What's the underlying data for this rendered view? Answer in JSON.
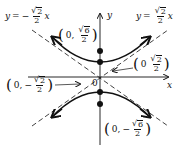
{
  "diagram": {
    "type": "hyperbola",
    "axes": {
      "x_label": "x",
      "y_label": "y",
      "origin_label": "0"
    },
    "asymptotes": [
      {
        "id": "neg",
        "lhs": "y",
        "eq": "=",
        "sign": "−",
        "num": "2",
        "den": "2",
        "var": "x"
      },
      {
        "id": "pos",
        "lhs": "y",
        "eq": "=",
        "sign": "",
        "num": "2",
        "den": "2",
        "var": "x"
      }
    ],
    "points": [
      {
        "id": "focus-top",
        "open": "(",
        "x": "0,",
        "sign": "",
        "num": "6",
        "den": "2",
        "close": ")"
      },
      {
        "id": "vertex-top",
        "open": "(",
        "x": "0",
        "sign": "",
        "num": "2",
        "den": "2",
        "close": ")"
      },
      {
        "id": "vertex-bottom",
        "open": "(",
        "x": "0,",
        "sign": "−",
        "num": "2",
        "den": "2",
        "close": ")"
      },
      {
        "id": "focus-bottom",
        "open": "(",
        "x": "0,",
        "sign": "−",
        "num": "6",
        "den": "2",
        "close": ")"
      }
    ],
    "sqrt_symbol": "√",
    "colors": {
      "ink": "#111111",
      "background": "#ffffff"
    }
  }
}
